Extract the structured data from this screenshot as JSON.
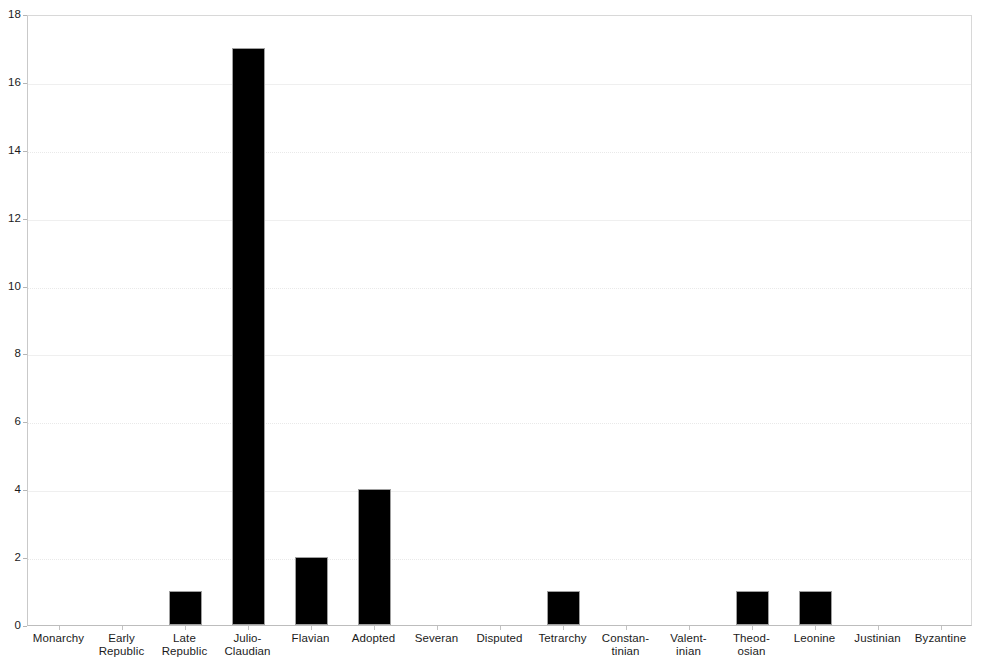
{
  "chart_data": {
    "type": "bar",
    "title": "",
    "subtitle": "",
    "xlabel": "",
    "ylabel": "",
    "ylim": [
      0,
      18
    ],
    "ytick_step": 2,
    "ytick_labels": [
      "0",
      "2",
      "4",
      "6",
      "8",
      "10",
      "12",
      "14",
      "16",
      "18"
    ],
    "grid": true,
    "grid_axis": "y",
    "legend": false,
    "legend_position": "none",
    "bar_color": "#000000",
    "bar_edge_color": "#9f9f9f",
    "background_color": "#ffffff",
    "gridline_color": "#e9e9e9",
    "axis_color": "#b5b5b5",
    "categories": [
      "Monarchy",
      "Early\nRepublic",
      "Late\nRepublic",
      "Julio-\nClaudian",
      "Flavian",
      "Adopted",
      "Severan",
      "Disputed",
      "Tetrarchy",
      "Constan-\ntinian",
      "Valent-\ninian",
      "Theod-\nosian",
      "Leonine",
      "Justinian",
      "Byzantine"
    ],
    "values": [
      0,
      0,
      1,
      17,
      2,
      4,
      0,
      0,
      1,
      0,
      0,
      1,
      1,
      0,
      0
    ]
  }
}
